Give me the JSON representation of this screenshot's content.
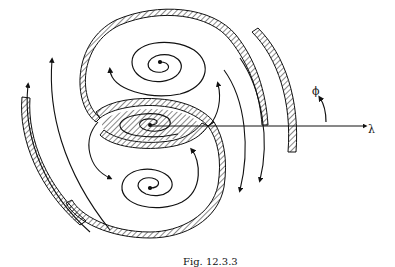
{
  "figure": {
    "caption": "Fig. 12.3.3",
    "axis_labels": {
      "horizontal": "λ",
      "rotation": "ϕ"
    },
    "colors": {
      "ink": "#111111",
      "background": "#ffffff"
    },
    "elements": [
      "hatched S-shaped separatrix band",
      "upper spiral vortex",
      "lower spiral vortex",
      "central saddle spiral",
      "outer hatched arcs left and right",
      "horizontal axis arrow",
      "curved rotation arrow"
    ]
  }
}
